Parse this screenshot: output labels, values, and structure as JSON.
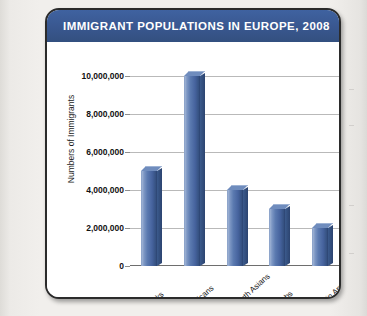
{
  "card": {
    "title": "IMMIGRANT POPULATIONS IN EUROPE, 2008"
  },
  "colors": {
    "title_bar": "#39578f",
    "title_text": "#ffffff",
    "bar_fill": "#46639e",
    "bar_light": "#9fb3d4",
    "bar_dark": "#2f4877",
    "gridline": "#b9b9b9",
    "card_border": "#2b2b2b",
    "page_background": "#f1efec"
  },
  "chart_data": {
    "type": "bar",
    "title": "IMMIGRANT POPULATIONS IN EUROPE, 2008",
    "xlabel": "",
    "ylabel": "Numbers of Immigrants",
    "categories": [
      "Turks",
      "Africans",
      "South Asians",
      "Arabs",
      "Latin Americans"
    ],
    "values": [
      5000000,
      10000000,
      4000000,
      3000000,
      2000000
    ],
    "ylim": [
      0,
      10000000
    ],
    "yticks": [
      0,
      2000000,
      4000000,
      6000000,
      8000000,
      10000000
    ],
    "ytick_labels": [
      "0",
      "2,000,000",
      "4,000,000",
      "6,000,000",
      "8,000,000",
      "10,000,000"
    ],
    "grid": true,
    "legend": false,
    "three_d": true,
    "bar_color": "#46639e"
  }
}
